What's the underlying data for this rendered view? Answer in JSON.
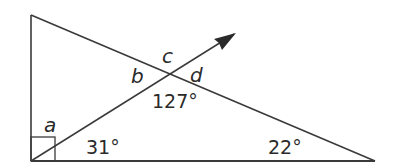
{
  "diagram": {
    "type": "geometry-triangle",
    "colors": {
      "line": "#3a3a3a",
      "text": "#2a2a2a",
      "background": "#ffffff"
    },
    "labels": {
      "a": "a",
      "b": "b",
      "c": "c",
      "d": "d",
      "angle_127": "127°",
      "angle_31": "31°",
      "angle_22": "22°"
    },
    "angles": [
      {
        "name": "a",
        "location": "right-angle vertex, above ray",
        "value": null
      },
      {
        "name": "b",
        "location": "intersection, left",
        "value": null
      },
      {
        "name": "c",
        "location": "intersection, top",
        "value": null
      },
      {
        "name": "d",
        "location": "intersection, right",
        "value": null
      },
      {
        "name": "127",
        "location": "intersection, bottom",
        "value": 127
      },
      {
        "name": "31",
        "location": "bottom-left vertex, below ray",
        "value": 31
      },
      {
        "name": "22",
        "location": "bottom-right vertex",
        "value": 22
      },
      {
        "name": "right-angle",
        "location": "bottom-left vertex",
        "value": 90
      }
    ]
  }
}
